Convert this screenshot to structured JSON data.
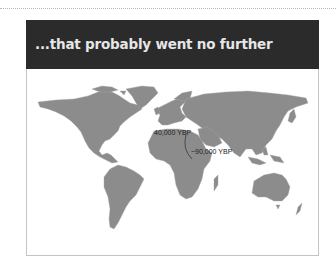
{
  "slide": {
    "title": "...that probably went no further",
    "colors": {
      "header_bg": "#2b2b2b",
      "title_text": "#e6e6e6",
      "land": "#8c8c8c",
      "border": "#c4c4c4"
    }
  },
  "map": {
    "type": "world-map",
    "annotations": [
      {
        "id": "europe",
        "label": "40,000 YBP"
      },
      {
        "id": "middle-east",
        "label": "~90,000 YBP"
      }
    ]
  }
}
